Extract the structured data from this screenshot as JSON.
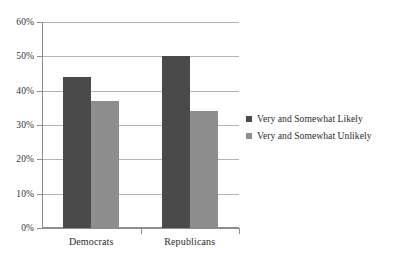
{
  "chart_data": {
    "type": "bar",
    "title": "",
    "subtitle": "",
    "xlabel": "",
    "ylabel": "",
    "categories": [
      "Democrats",
      "Republicans"
    ],
    "series": [
      {
        "name": "Very and Somewhat Likely",
        "values": [
          44,
          50
        ],
        "color": "#4a4a4a"
      },
      {
        "name": "Very and Somewhat Unlikely",
        "values": [
          37,
          34
        ],
        "color": "#8d8d8d"
      }
    ],
    "ylim": [
      0,
      60
    ],
    "y_tick_values": [
      0,
      10,
      20,
      30,
      40,
      50,
      60
    ],
    "y_tick_labels": [
      "0%",
      "10%",
      "20%",
      "30%",
      "40%",
      "50%",
      "60%"
    ],
    "grid": true,
    "grid_axis": "y",
    "legend_position": "right",
    "value_suffix": "%",
    "background_color": "#ffffff",
    "gridline_color": "#b4b4b4",
    "axis_color": "#8d8d8d"
  }
}
